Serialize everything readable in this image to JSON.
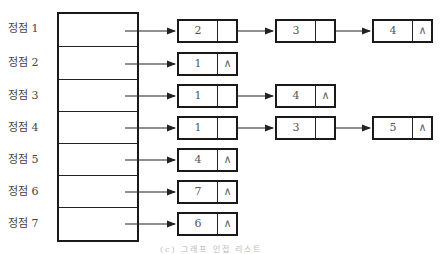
{
  "diagram": {
    "type": "adjacency-list",
    "null_symbol": "∧",
    "caption": "(c) 그래프 인접 리스트",
    "vertices": [
      {
        "label": "정점 1",
        "list": [
          "2",
          "3",
          "4"
        ]
      },
      {
        "label": "정점 2",
        "list": [
          "1"
        ]
      },
      {
        "label": "정점 3",
        "list": [
          "1",
          "4"
        ]
      },
      {
        "label": "정점 4",
        "list": [
          "1",
          "3",
          "5"
        ]
      },
      {
        "label": "정점 5",
        "list": [
          "4"
        ]
      },
      {
        "label": "정점 6",
        "list": [
          "7"
        ]
      },
      {
        "label": "정점 7",
        "list": [
          "6"
        ]
      }
    ]
  }
}
